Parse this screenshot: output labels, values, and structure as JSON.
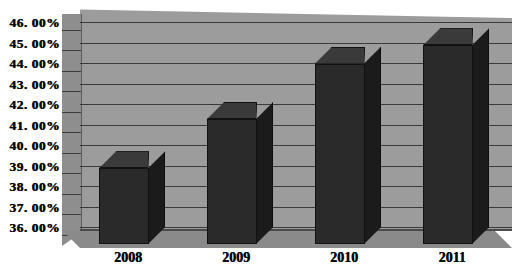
{
  "chart_data": {
    "type": "bar",
    "title": "",
    "subtitle": "",
    "xlabel": "",
    "ylabel": "",
    "categories": [
      "2008",
      "2009",
      "2010",
      "2011"
    ],
    "values": [
      39.7,
      42.1,
      44.8,
      45.7
    ],
    "value_labels": [
      "",
      "",
      "",
      ""
    ],
    "series": [
      {
        "name": "",
        "values": [
          39.7,
          42.1,
          44.8,
          45.7
        ]
      }
    ],
    "ylim": [
      36.0,
      46.0
    ],
    "ytick_values": [
      36.0,
      37.0,
      38.0,
      39.0,
      40.0,
      41.0,
      42.0,
      43.0,
      44.0,
      45.0,
      46.0
    ],
    "ytick_labels": [
      "36. 00%",
      "37. 00%",
      "38. 00%",
      "39. 00%",
      "40. 00%",
      "41. 00%",
      "42. 00%",
      "43. 00%",
      "44. 00%",
      "45. 00%",
      "46. 00%"
    ],
    "grid": true,
    "legend": false,
    "legend_position": "none",
    "three_d": true,
    "annotations": []
  },
  "colors": {
    "plot_background": "#9c9c9c",
    "left_wall": "#8e8e8e",
    "floor": "#8a8a8a",
    "gridline": "#3b3b3b",
    "bar_front": "#2a2a2a",
    "bar_side": "#1b1b1b",
    "bar_top": "#3a3a3a",
    "text": "#0a0a0a",
    "page_background": "#ffffff"
  }
}
